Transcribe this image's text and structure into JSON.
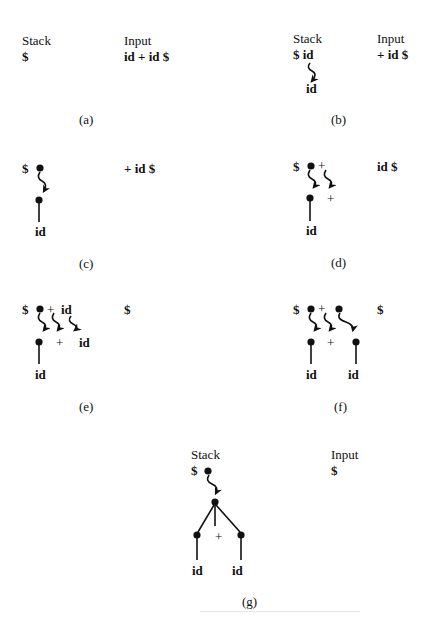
{
  "figure": {
    "panels": [
      {
        "id": "a",
        "caption": "(a)",
        "stack_header": "Stack",
        "input_header": "Input",
        "stack": "$",
        "input": "id + id $",
        "tree": {
          "nodes": [],
          "edges": [],
          "arrows": []
        }
      },
      {
        "id": "b",
        "caption": "(b)",
        "stack_header": "Stack",
        "input_header": "Input",
        "stack": "$ id",
        "input": "+ id $",
        "tree": {
          "leaves": [
            "id"
          ],
          "arrows": 1
        }
      },
      {
        "id": "c",
        "caption": "(c)",
        "stack": "$",
        "input": "+ id $",
        "tree": {
          "leaves": [
            "id"
          ],
          "arrows": 1
        }
      },
      {
        "id": "d",
        "caption": "(d)",
        "stack": "$",
        "stack_symbols": [
          "+"
        ],
        "input": "id $",
        "tree": {
          "leaves": [
            "id",
            "+"
          ],
          "arrows": 2
        }
      },
      {
        "id": "e",
        "caption": "(e)",
        "stack": "$",
        "stack_symbols": [
          "+",
          "id"
        ],
        "input": "$",
        "tree": {
          "leaves": [
            "id",
            "+",
            "id"
          ],
          "arrows": 3
        }
      },
      {
        "id": "f",
        "caption": "(f)",
        "stack": "$",
        "stack_symbols": [
          "+"
        ],
        "input": "$",
        "tree": {
          "leaves": [
            "id",
            "+",
            "id"
          ],
          "arrows": 3
        }
      },
      {
        "id": "g",
        "caption": "(g)",
        "stack_header": "Stack",
        "input_header": "Input",
        "stack": "$",
        "input": "$",
        "tree": {
          "root_children": [
            "id-node",
            "+",
            "id-node"
          ],
          "leaves": [
            "id",
            "id"
          ],
          "arrows": 1
        }
      }
    ],
    "labels": {
      "id": "id",
      "plus": "+"
    }
  }
}
